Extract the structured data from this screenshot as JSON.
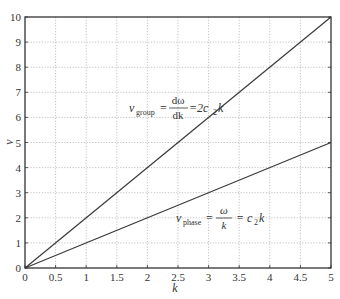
{
  "chart_data": {
    "type": "line",
    "title": "",
    "xlabel": "k",
    "ylabel": "v",
    "xlim": [
      0,
      5
    ],
    "ylim": [
      0,
      10
    ],
    "grid": true,
    "legend": "none",
    "x_ticks": [
      0,
      0.5,
      1,
      1.5,
      2,
      2.5,
      3,
      3.5,
      4,
      4.5,
      5
    ],
    "x_tick_labels": [
      "0",
      "0.5",
      "1",
      "1.5",
      "2",
      "2.5",
      "3",
      "3.5",
      "4",
      "4.5",
      "5"
    ],
    "y_ticks": [
      0,
      1,
      2,
      3,
      4,
      5,
      6,
      7,
      8,
      9,
      10
    ],
    "y_tick_labels": [
      "0",
      "1",
      "2",
      "3",
      "4",
      "5",
      "6",
      "7",
      "8",
      "9",
      "10"
    ],
    "x": [
      0,
      5
    ],
    "series": [
      {
        "name": "v_group",
        "values": [
          0,
          10
        ]
      },
      {
        "name": "v_phase",
        "values": [
          0,
          5
        ]
      }
    ],
    "annotations": [
      {
        "id": "group",
        "text": "v_group = dω/dk = 2c₂k",
        "x": 1.55,
        "y": 7.0
      },
      {
        "id": "phase",
        "text": "v_phase = ω/k = c₂k",
        "x": 3.3,
        "y": 1.5
      }
    ]
  },
  "labels": {
    "xlabel": "k",
    "ylabel": "v",
    "group": {
      "v": "v",
      "sub": "group",
      "eq1": "=",
      "num": "dω",
      "den": "dk",
      "eq2": "=2c",
      "sub2": "2",
      "k": "k"
    },
    "phase": {
      "v": "v",
      "sub": "phase",
      "eq1": "=",
      "num": "ω",
      "den": "k",
      "eq2": "= c",
      "sub2": "2",
      "k": "k"
    }
  }
}
